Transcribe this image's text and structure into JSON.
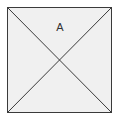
{
  "diagram": {
    "label": "A",
    "colors": {
      "fill": "#f0f0f0",
      "stroke": "#3a3a3a",
      "label": "#333333"
    },
    "shape": "square-with-diagonals"
  }
}
